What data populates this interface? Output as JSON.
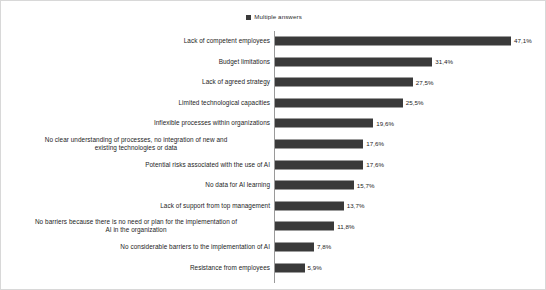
{
  "chart_data": {
    "type": "bar",
    "orientation": "horizontal",
    "title": "",
    "subtitle": "",
    "xlabel": "",
    "ylabel": "",
    "grid": false,
    "legend_position": "top-center",
    "legend": [
      {
        "name": "Multiple answers",
        "color": "#3a3a3a",
        "marker": "square"
      }
    ],
    "axis_range": [
      0,
      50
    ],
    "value_suffix": "%",
    "decimal_separator": ",",
    "categories": [
      "Lack of competent employees",
      "Budget limitations",
      "Lack of agreed strategy",
      "Limited technological capacities",
      "Inflexible processes within organizations",
      "No clear understanding of processes, no integration of new and existing technologies or data",
      "Potential risks associated with the use of AI",
      "No data for AI learning",
      "Lack of support from top management",
      "No barriers because there is no need or plan for the implementation of AI in the organization",
      "No considerable barriers to the implementation of AI",
      "Resistance from employees"
    ],
    "values": [
      47.1,
      31.4,
      27.5,
      25.5,
      19.6,
      17.6,
      17.6,
      15.7,
      13.7,
      11.8,
      7.8,
      5.9
    ],
    "value_labels": [
      "47,1%",
      "31,4%",
      "27,5%",
      "25,5%",
      "19,6%",
      "17,6%",
      "17,6%",
      "15,7%",
      "13,7%",
      "11,8%",
      "7,8%",
      "5,9%"
    ],
    "series": [
      {
        "name": "Multiple answers",
        "values": [
          47.1,
          31.4,
          27.5,
          25.5,
          19.6,
          17.6,
          17.6,
          15.7,
          13.7,
          11.8,
          7.8,
          5.9
        ]
      }
    ]
  },
  "colors": {
    "bar": "#3a3a3a",
    "axis": "#9a9a9a",
    "text": "#1d1d1d",
    "background": "#ffffff",
    "frame": "#d8d8d8"
  },
  "rows": [
    {
      "label": "Lack of competent employees",
      "value": 47.1,
      "value_label": "47,1%",
      "lines": 1
    },
    {
      "label": "Budget limitations",
      "value": 31.4,
      "value_label": "31,4%",
      "lines": 1
    },
    {
      "label": "Lack of agreed strategy",
      "value": 27.5,
      "value_label": "27,5%",
      "lines": 1
    },
    {
      "label": "Limited technological capacities",
      "value": 25.5,
      "value_label": "25,5%",
      "lines": 1
    },
    {
      "label": "Inflexible processes within organizations",
      "value": 19.6,
      "value_label": "19,6%",
      "lines": 1
    },
    {
      "label": "No clear understanding of processes, no integration of new and\nexisting technologies or data",
      "value": 17.6,
      "value_label": "17,6%",
      "lines": 2
    },
    {
      "label": "Potential risks associated with the use of AI",
      "value": 17.6,
      "value_label": "17,6%",
      "lines": 1
    },
    {
      "label": "No data for AI learning",
      "value": 15.7,
      "value_label": "15,7%",
      "lines": 1
    },
    {
      "label": "Lack of support from top management",
      "value": 13.7,
      "value_label": "13,7%",
      "lines": 1
    },
    {
      "label": "No barriers because there is no need or plan for the implementation of\nAI in the organization",
      "value": 11.8,
      "value_label": "11,8%",
      "lines": 2
    },
    {
      "label": "No considerable barriers to the implementation of AI",
      "value": 7.8,
      "value_label": "7,8%",
      "lines": 1
    },
    {
      "label": "Resistance from employees",
      "value": 5.9,
      "value_label": "5,9%",
      "lines": 1
    }
  ]
}
